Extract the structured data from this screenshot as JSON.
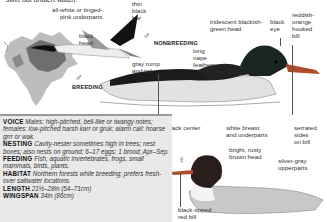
{
  "header": {
    "cut_text": "swift but unalert watch."
  },
  "symbols": {
    "male": "♂",
    "female": "♀"
  },
  "stages": {
    "nonbreeding": "NONBREEDING",
    "breeding": "BREEDING"
  },
  "labels": {
    "underparts": "all-white or tinged-\npink underparts",
    "black_head": "black\nhead",
    "thin_black_bar": "thin\nblack\nbar",
    "gray_rump": "gray rump\nand tail",
    "iridescent_head": "iridescent blackish-\ngreen head",
    "black_eye": "black\neye",
    "hooked_bill": "reddish-\norange\nhooked\nbill",
    "nape_feathers": "long\nnape\nfeathers",
    "black_center": "black center",
    "white_breast": "white breast\nand underparts",
    "serrated_bill": "serrated\nsides\non bill",
    "rusty_head": "bright, rusty\nbrown head",
    "silver_gray": "silver-gray\nupperparts",
    "black_tipped_bill": "black-tipped\nred bill"
  },
  "info": [
    {
      "key": "VOICE",
      "value": "Males: high-pitched, bell-like or twangy notes; females: low-pitched harsh karr or gruk; alarm call: hoarse grrr or wak."
    },
    {
      "key": "NESTING",
      "value": "Cavity-nester sometimes high in trees; nest boxes; also nests on ground; 6–17 eggs; 1 brood; Apr–Sep."
    },
    {
      "key": "FEEDING",
      "value": "Fish, aquatic invertebrates, frogs, small mammals, birds, plants."
    },
    {
      "key": "HABITAT",
      "value": "Northern forests while breeding; prefers fresh- over saltwater locations."
    },
    {
      "key": "LENGTH",
      "value": "21½–28in (54–71cm)"
    },
    {
      "key": "WINGSPAN",
      "value": "34in (86cm)"
    }
  ],
  "colors": {
    "map_land": "#bdbdbd",
    "map_range": "#6e6e6e",
    "info_bg": "#e9e9e9",
    "bill": "#b04a2a",
    "female_head": "#7a3a22",
    "male_head": "#1a2420"
  }
}
